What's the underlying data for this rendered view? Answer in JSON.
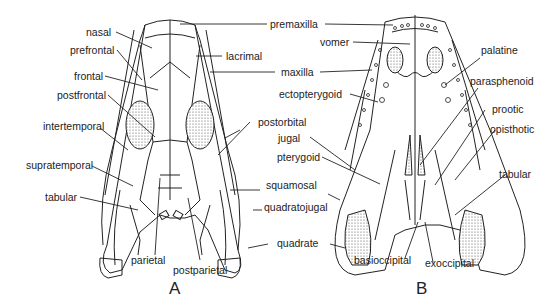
{
  "figure": {
    "panel_a": {
      "letter": "A",
      "view": "dorsal skull",
      "labels": {
        "nasal": "nasal",
        "prefrontal": "prefrontal",
        "frontal": "frontal",
        "postfrontal": "postfrontal",
        "intertemporal": "intertemporal",
        "supratemporal": "supratemporal",
        "tabular": "tabular",
        "parietal": "parietal",
        "postparietal": "postparietal",
        "lacrimal": "lacrimal",
        "postorbital": "postorbital",
        "squamosal": "squamosal",
        "quadratojugal": "quadratojugal",
        "quadrate": "quadrate"
      }
    },
    "shared_labels": {
      "premaxilla": "premaxilla",
      "maxilla": "maxilla",
      "jugal": "jugal",
      "pterygoid": "pterygoid"
    },
    "panel_b": {
      "letter": "B",
      "view": "ventral (palatal) skull",
      "labels": {
        "vomer": "vomer",
        "ectopterygoid": "ectopterygoid",
        "palatine": "palatine",
        "parasphenoid": "parasphenoid",
        "prootic": "prootic",
        "opisthotic": "opisthotic",
        "tabular": "tabular",
        "basioccipital": "basioccipital",
        "exoccipital": "exoccipital"
      }
    },
    "colors": {
      "line": "#222222",
      "stipple": "#cfcfcf",
      "background": "#ffffff"
    }
  }
}
